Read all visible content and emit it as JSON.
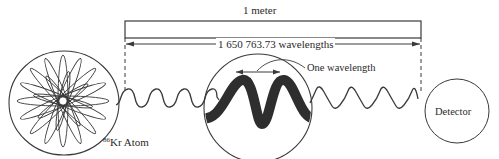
{
  "diagram": {
    "labels": {
      "length": "1 meter",
      "wavelength_count": "1 650 763.73 wavelengths",
      "one_wavelength": "One wavelength",
      "isotope_mass": "86",
      "atom": "Kr Atom",
      "detector": "Detector"
    },
    "components": [
      {
        "id": "krypton-atom",
        "shape": "circle",
        "content": "star-shaped electron orbitals"
      },
      {
        "id": "wave-left",
        "shape": "sine-wave",
        "cycles": 6
      },
      {
        "id": "magnified-wave",
        "shape": "circle",
        "content": "thick wave, single wavelength marked"
      },
      {
        "id": "wave-right",
        "shape": "sine-wave",
        "cycles": 6
      },
      {
        "id": "detector",
        "shape": "circle"
      }
    ],
    "colors": {
      "line": "#3a3a3a",
      "thick_wave": "#2e2e2e",
      "background": "#ffffff"
    }
  }
}
